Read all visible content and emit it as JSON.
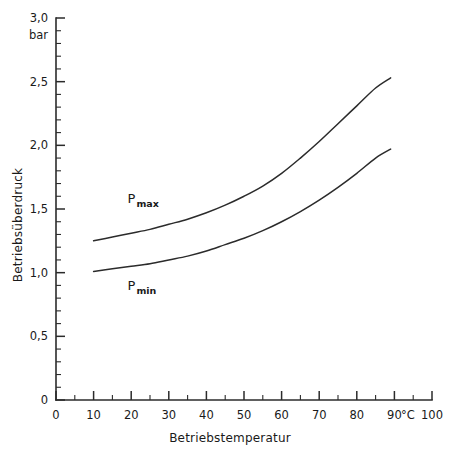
{
  "chart_data": {
    "type": "line",
    "title": "",
    "xlabel": "Betriebstemperatur",
    "ylabel": "Betriebsüberdruck",
    "x_unit": "°C",
    "y_unit": "bar",
    "xlim": [
      0,
      100
    ],
    "ylim": [
      0,
      3.0
    ],
    "grid": false,
    "legend_position": "inline-annotations",
    "x_major_ticks": [
      0,
      10,
      20,
      30,
      40,
      50,
      60,
      70,
      80,
      90,
      100
    ],
    "x_major_tick_labels": [
      "0",
      "10",
      "20",
      "30",
      "40",
      "50",
      "60",
      "70",
      "80",
      "90",
      "100"
    ],
    "x_minor_step": 5,
    "y_major_ticks": [
      0,
      0.5,
      1.0,
      1.5,
      2.0,
      2.5,
      3.0
    ],
    "y_major_tick_labels": [
      "0",
      "0,5",
      "1,0",
      "1,5",
      "2,0",
      "2,5",
      "3,0"
    ],
    "y_minor_step": 0.1,
    "x": [
      10,
      15,
      20,
      25,
      30,
      35,
      40,
      45,
      50,
      55,
      60,
      65,
      70,
      75,
      80,
      85,
      89
    ],
    "series": [
      {
        "name": "P max",
        "label_text": "P",
        "label_sub": "max",
        "values": [
          1.25,
          1.28,
          1.31,
          1.34,
          1.38,
          1.42,
          1.47,
          1.53,
          1.6,
          1.68,
          1.78,
          1.9,
          2.03,
          2.17,
          2.31,
          2.45,
          2.53
        ]
      },
      {
        "name": "P min",
        "label_text": "P",
        "label_sub": "min",
        "values": [
          1.01,
          1.03,
          1.05,
          1.07,
          1.1,
          1.13,
          1.17,
          1.22,
          1.27,
          1.33,
          1.4,
          1.48,
          1.57,
          1.67,
          1.78,
          1.9,
          1.97
        ]
      }
    ],
    "colors": {
      "curve": "#2b2b2b",
      "axis": "#2b2b2b",
      "background": "#ffffff",
      "text": "#1a1a1a"
    },
    "annotations": [
      {
        "name": "pmax-annotation",
        "text": "P",
        "sub": "max",
        "x": 19,
        "y": 1.55
      },
      {
        "name": "pmin-annotation",
        "text": "P",
        "sub": "min",
        "x": 19,
        "y": 0.86
      }
    ]
  }
}
